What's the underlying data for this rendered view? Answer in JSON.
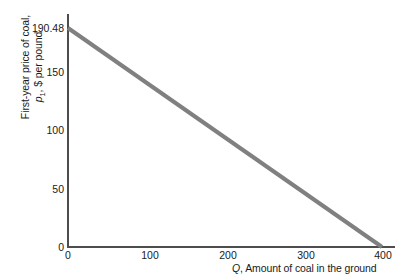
{
  "chart_data": {
    "type": "line",
    "title": "",
    "subtitle": "",
    "xlabel": "Q, Amount of coal in the ground",
    "xlabel_symbol": "Q",
    "xlabel_rest": ", Amount of coal in the ground",
    "ylabel_line1": "First-year price of coal,",
    "ylabel_symbol": "p",
    "ylabel_subscript": "1",
    "ylabel_line2_rest": ", $ per pound",
    "ylabel": "First-year price of coal, p1, $ per pound",
    "xlim": [
      0,
      420
    ],
    "ylim": [
      0,
      200
    ],
    "xticks": [
      0,
      100,
      200,
      300,
      400
    ],
    "xtick_labels": [
      "0",
      "100",
      "200",
      "300",
      "400"
    ],
    "yticks": [
      0,
      50,
      100,
      150,
      190.48
    ],
    "ytick_labels": [
      "0",
      "50",
      "100",
      "150",
      "190.48"
    ],
    "grid": false,
    "legend": false,
    "legend_position": "none",
    "series": [
      {
        "name": "Price path",
        "color": "#808080",
        "linewidth": 4,
        "x": [
          0,
          400
        ],
        "values": [
          190.48,
          0
        ],
        "points": [
          {
            "x": 0,
            "y": 190.48
          },
          {
            "x": 100,
            "y": 142.86
          },
          {
            "x": 200,
            "y": 95.24
          },
          {
            "x": 300,
            "y": 47.62
          },
          {
            "x": 400,
            "y": 0
          }
        ]
      }
    ],
    "annotations": [],
    "axis_color": "#4d4d4d",
    "background": "#ffffff"
  }
}
